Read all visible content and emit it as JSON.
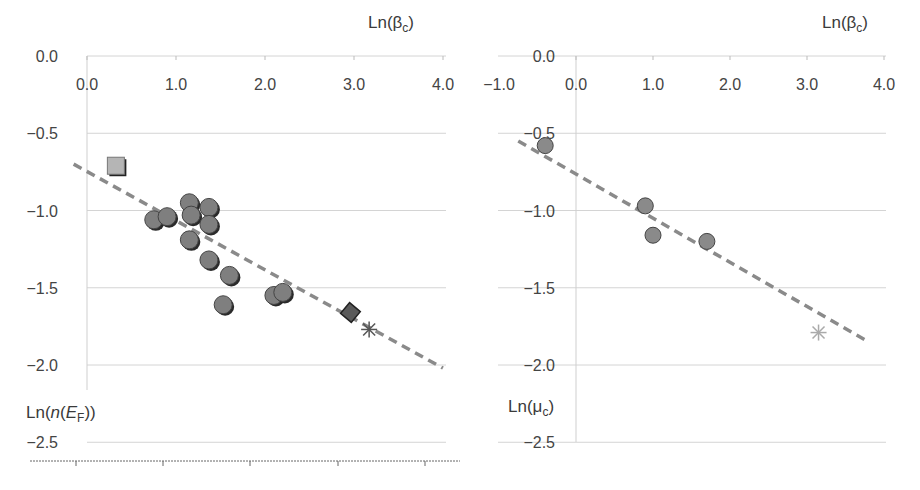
{
  "chart_data": [
    {
      "type": "scatter",
      "id": "left",
      "title": "",
      "xlabel": "Ln(βc)",
      "ylabel": "Ln(n(EF))",
      "x_ticks": [
        "0.0",
        "1.0",
        "2.0",
        "3.0",
        "4.0"
      ],
      "y_ticks": [
        "0.0",
        "-0.5",
        "-1.0",
        "-1.5",
        "-2.0",
        "-2.5"
      ],
      "xlim": [
        0.0,
        4.0
      ],
      "ylim": [
        -2.5,
        0.0
      ],
      "grid": true,
      "x_axis_position": "top",
      "series": [
        {
          "name": "square",
          "marker": "square",
          "color": "#b5b5b5",
          "points": [
            [
              0.33,
              -0.72
            ]
          ]
        },
        {
          "name": "circles",
          "marker": "circle",
          "color": "#7f7f7f",
          "points": [
            [
              0.75,
              -1.06
            ],
            [
              0.9,
              -1.04
            ],
            [
              1.15,
              -0.95
            ],
            [
              1.17,
              -1.03
            ],
            [
              1.37,
              -0.98
            ],
            [
              1.37,
              -1.09
            ],
            [
              1.15,
              -1.19
            ],
            [
              1.37,
              -1.32
            ],
            [
              1.6,
              -1.42
            ],
            [
              1.53,
              -1.61
            ],
            [
              2.1,
              -1.55
            ],
            [
              2.2,
              -1.53
            ]
          ]
        },
        {
          "name": "diamond",
          "marker": "diamond",
          "color": "#5a5a5a",
          "points": [
            [
              2.96,
              -1.66
            ]
          ]
        },
        {
          "name": "star",
          "marker": "asterisk",
          "color": "#555555",
          "points": [
            [
              3.17,
              -1.77
            ]
          ]
        }
      ],
      "fit_line": {
        "style": "dashed",
        "color": "#8a8a8a",
        "from": [
          -0.15,
          -0.7
        ],
        "to": [
          4.0,
          -2.02
        ]
      }
    },
    {
      "type": "scatter",
      "id": "right",
      "title": "",
      "xlabel": "Ln(βc)",
      "ylabel": "Ln(μc)",
      "x_ticks": [
        "-1.0",
        "0.0",
        "1.0",
        "2.0",
        "3.0",
        "4.0"
      ],
      "y_ticks": [
        "0.0",
        "-0.5",
        "-1.0",
        "-1.5",
        "-2.0",
        "-2.5"
      ],
      "xlim": [
        -1.0,
        4.0
      ],
      "ylim": [
        -2.5,
        0.0
      ],
      "grid": true,
      "x_axis_position": "top",
      "series": [
        {
          "name": "circles",
          "marker": "circle",
          "color": "#8a8a8a",
          "points": [
            [
              -0.4,
              -0.58
            ],
            [
              0.9,
              -0.97
            ],
            [
              1.0,
              -1.16
            ],
            [
              1.7,
              -1.2
            ]
          ]
        },
        {
          "name": "star",
          "marker": "asterisk",
          "color": "#aaaaaa",
          "points": [
            [
              3.15,
              -1.79
            ]
          ]
        }
      ],
      "fit_line": {
        "style": "dashed",
        "color": "#8a8a8a",
        "from": [
          -0.75,
          -0.55
        ],
        "to": [
          3.8,
          -1.85
        ]
      }
    }
  ],
  "labels": {
    "left_x_title": "Ln(β",
    "left_x_sub": "c",
    "left_y_title_a": "Ln(",
    "left_y_title_n": "n",
    "left_y_title_b": "(",
    "left_y_title_E": "E",
    "left_y_title_sub": "F",
    "left_y_title_c": "))",
    "right_x_title": "Ln(β",
    "right_x_sub": "c",
    "right_y_title": "Ln(μ",
    "right_y_sub": "c",
    "paren_close": ")"
  }
}
